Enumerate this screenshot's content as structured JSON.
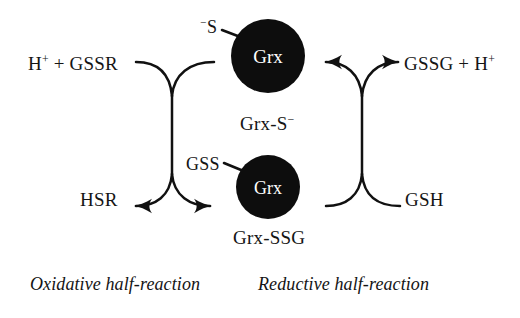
{
  "figure": {
    "type": "biochemical-reaction-diagram",
    "background_color": "#ffffff",
    "ink_color": "#111111",
    "node_fill_color": "#0d0d0d",
    "node_text_color": "#ffffff"
  },
  "nodes": {
    "grx_top": {
      "label": "Grx",
      "thiolate_label_prefix": "−",
      "thiolate_label_text": "S",
      "state": "Grx-S− (reduced thiolate)"
    },
    "grx_bottom": {
      "label": "Grx",
      "attached_label": "GSS",
      "state": "Grx-SSG (glutathionylated)"
    }
  },
  "labels": {
    "top_left": {
      "pre": "H",
      "sup": "+",
      "post": " + GSSR"
    },
    "top_right": {
      "pre": "GSSG + H",
      "sup": "+",
      "post": ""
    },
    "bottom_left": "HSR",
    "bottom_right": "GSH",
    "center_state": {
      "pre": "Grx-S",
      "sup": "−"
    },
    "bottom_state": "Grx-SSG",
    "attached_left": "GSS",
    "attached_top": {
      "sup": "−",
      "text": "S"
    }
  },
  "captions": {
    "left": "Oxidative half-reaction",
    "right": "Reductive half-reaction"
  },
  "reactions": {
    "oxidative": {
      "substrates": "H+ + GSSR",
      "products": "HSR",
      "direction": "top-to-bottom",
      "arrowheads": [
        "bottom-left",
        "bottom-right"
      ]
    },
    "reductive": {
      "substrates": "GSH",
      "products": "GSSG + H+",
      "direction": "bottom-to-top",
      "arrowheads": [
        "top-left",
        "top-right"
      ]
    }
  }
}
